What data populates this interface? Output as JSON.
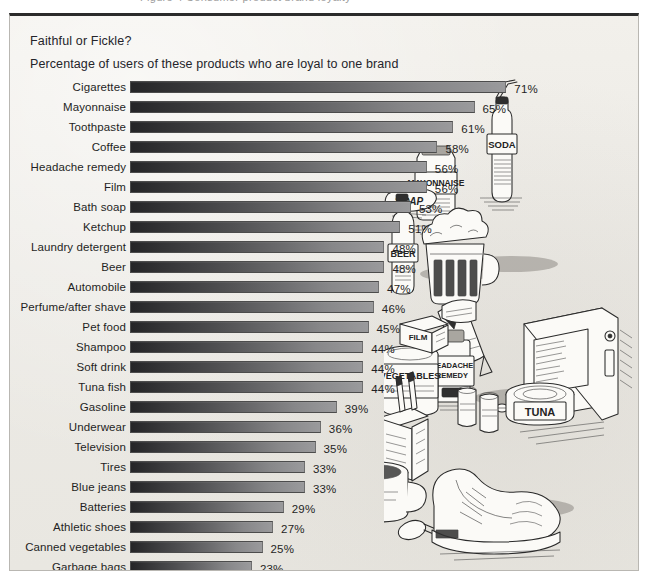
{
  "page": {
    "top_caption_fragment": "Figure 4   Consumer product brand loyalty"
  },
  "figure": {
    "title": "Faithful or Fickle?",
    "subtitle": "Percentage of users of these products who are loyal to one brand",
    "background_color": "#eeece7",
    "bar_color_dark": "#252527",
    "bar_color_light": "#9a9a9c",
    "frame_border_color": "#2b2b2b"
  },
  "illustration": {
    "name": "pen-and-ink-product-still-life",
    "item_labels": {
      "soda": "SODA",
      "mayonnaise": "MAYONNAISE",
      "soap": "SOAP",
      "beer": "BEER",
      "headache_remedy": "HEADACHE REMEDY",
      "vegetables": "VEGETABLES",
      "tuna": "TUNA",
      "film": "FILM"
    },
    "depicted_items": [
      "soda-bottle-with-straw",
      "mayonnaise-jar",
      "bar-of-soap",
      "beer-bottle",
      "beer-mug",
      "headache-remedy-bottle",
      "pills",
      "television-set",
      "canned-vegetables",
      "tuna-can",
      "cigarette-pack",
      "cigarettes",
      "film-box",
      "film-canister",
      "batteries",
      "coffee-mug",
      "spoon",
      "athletic-shoe",
      "toothpaste-tube"
    ]
  },
  "chart_data": {
    "type": "bar",
    "orientation": "horizontal",
    "title": "Faithful or Fickle?",
    "subtitle": "Percentage of users of these products who are loyal to one brand",
    "xlabel": "",
    "ylabel": "",
    "xlim": [
      0,
      71
    ],
    "grid": false,
    "legend": false,
    "value_suffix": "%",
    "categories": [
      "Cigarettes",
      "Mayonnaise",
      "Toothpaste",
      "Coffee",
      "Headache remedy",
      "Film",
      "Bath soap",
      "Ketchup",
      "Laundry detergent",
      "Beer",
      "Automobile",
      "Perfume/after shave",
      "Pet food",
      "Shampoo",
      "Soft drink",
      "Tuna fish",
      "Gasoline",
      "Underwear",
      "Television",
      "Tires",
      "Blue jeans",
      "Batteries",
      "Athletic shoes",
      "Canned vegetables",
      "Garbage bags"
    ],
    "values": [
      71,
      65,
      61,
      58,
      56,
      56,
      53,
      51,
      48,
      48,
      47,
      46,
      45,
      44,
      44,
      44,
      39,
      36,
      35,
      33,
      33,
      29,
      27,
      25,
      23
    ],
    "labels": [
      "71%",
      "65%",
      "61%",
      "58%",
      "56%",
      "56%",
      "53%",
      "51%",
      "48%",
      "48%",
      "47%",
      "46%",
      "45%",
      "44%",
      "44%",
      "44%",
      "39%",
      "36%",
      "35%",
      "33%",
      "33%",
      "29%",
      "27%",
      "25%",
      "23%"
    ]
  }
}
